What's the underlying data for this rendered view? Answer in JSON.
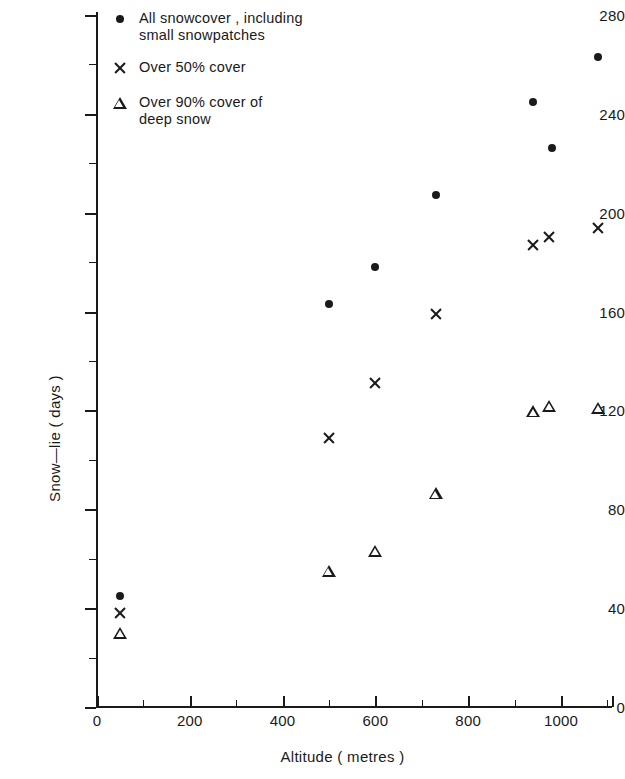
{
  "chart_data": {
    "type": "scatter",
    "title": "",
    "xlabel": "Altitude ( metres )",
    "ylabel": "Snow—lie ( days )",
    "xlim": [
      0,
      1130
    ],
    "ylim": [
      0,
      280
    ],
    "x_ticks_major": [
      0,
      200,
      400,
      600,
      800,
      1000
    ],
    "x_ticks_minor": [
      100,
      300,
      500,
      700,
      900,
      1100
    ],
    "y_ticks_major": [
      0,
      40,
      80,
      120,
      160,
      200,
      240,
      280
    ],
    "y_ticks_minor": [
      20,
      60,
      100,
      140,
      180,
      220,
      260
    ],
    "grid": false,
    "legend_position": "top-left",
    "series": [
      {
        "name": "All snowcover , including\nsmall snowpatches",
        "marker": "dot",
        "points": [
          {
            "x": 50,
            "y": 45
          },
          {
            "x": 500,
            "y": 163
          },
          {
            "x": 600,
            "y": 178
          },
          {
            "x": 730,
            "y": 207
          },
          {
            "x": 940,
            "y": 245
          },
          {
            "x": 980,
            "y": 226
          },
          {
            "x": 1080,
            "y": 263
          }
        ]
      },
      {
        "name": "Over 50% cover",
        "marker": "cross",
        "points": [
          {
            "x": 50,
            "y": 38
          },
          {
            "x": 500,
            "y": 109
          },
          {
            "x": 600,
            "y": 131
          },
          {
            "x": 730,
            "y": 159
          },
          {
            "x": 940,
            "y": 187
          },
          {
            "x": 975,
            "y": 190
          },
          {
            "x": 1080,
            "y": 194
          }
        ]
      },
      {
        "name": "Over 90% cover of\ndeep snow",
        "marker": "triangle",
        "points": [
          {
            "x": 50,
            "y": 30
          },
          {
            "x": 500,
            "y": 60
          },
          {
            "x": 600,
            "y": 73
          },
          {
            "x": 730,
            "y": 101
          },
          {
            "x": 940,
            "y": 139
          },
          {
            "x": 975,
            "y": 146
          },
          {
            "x": 1080,
            "y": 150
          }
        ]
      }
    ]
  },
  "legend": {
    "items": [
      {
        "marker": "dot",
        "label": "All snowcover , including\nsmall snowpatches"
      },
      {
        "marker": "cross",
        "label": "Over 50% cover"
      },
      {
        "marker": "triangle",
        "label": "Over 90% cover of\ndeep snow"
      }
    ]
  },
  "axes": {
    "x_title": "Altitude ( metres )",
    "y_title": "Snow—lie ( days )"
  },
  "colors": {
    "ink": "#1a1a1a",
    "background": "#ffffff"
  }
}
